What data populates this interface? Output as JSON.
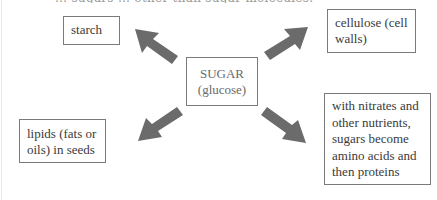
{
  "diagram": {
    "type": "radial-flow",
    "top_clipped_text": "… sugars … other than sugar molecules.",
    "center": {
      "label_line1": "SUGAR",
      "label_line2": "(glucose)"
    },
    "nodes": [
      {
        "id": "starch",
        "lines": [
          "starch"
        ],
        "position": "upper-left"
      },
      {
        "id": "cellulose",
        "lines": [
          "cellulose (cell",
          "walls)"
        ],
        "position": "upper-right"
      },
      {
        "id": "lipids",
        "lines": [
          "lipids (fats or",
          "oils) in seeds"
        ],
        "position": "lower-left"
      },
      {
        "id": "proteins",
        "lines": [
          "with nitrates and",
          "other nutrients,",
          "sugars become",
          "amino acids and",
          "then proteins"
        ],
        "position": "lower-right"
      }
    ],
    "arrows": [
      {
        "from": "sugar",
        "to": "starch",
        "direction": "up-left"
      },
      {
        "from": "sugar",
        "to": "cellulose",
        "direction": "up-right"
      },
      {
        "from": "sugar",
        "to": "lipids",
        "direction": "down-left"
      },
      {
        "from": "sugar",
        "to": "proteins",
        "direction": "down-right"
      }
    ],
    "colors": {
      "arrow": "#6b6b6b",
      "border": "#7a7a7a",
      "text": "#3a3a3a",
      "center_text": "#6a6a6a"
    }
  }
}
